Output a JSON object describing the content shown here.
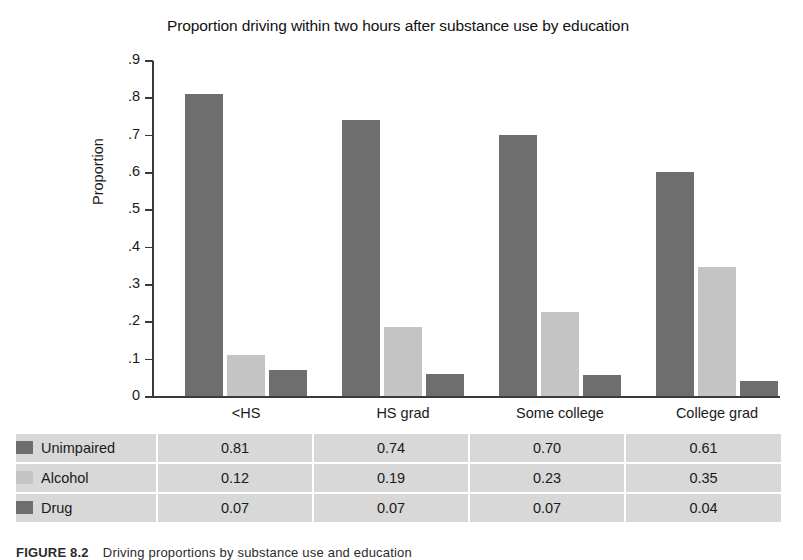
{
  "chart_data": {
    "type": "bar",
    "title": "Proportion driving within two hours after substance use by education",
    "xlabel": "",
    "ylabel": "Proportion",
    "categories": [
      "<HS",
      "HS grad",
      "Some college",
      "College grad"
    ],
    "series": [
      {
        "name": "Unimpaired",
        "color": "#6e6e6e",
        "values": [
          0.81,
          0.74,
          0.7,
          0.6
        ],
        "table_values": [
          "0.81",
          "0.74",
          "0.70",
          "0.61"
        ]
      },
      {
        "name": "Alcohol",
        "color": "#c4c4c4",
        "values": [
          0.11,
          0.185,
          0.225,
          0.345
        ],
        "table_values": [
          "0.12",
          "0.19",
          "0.23",
          "0.35"
        ]
      },
      {
        "name": "Drug",
        "color": "#6e6e6e",
        "values": [
          0.07,
          0.06,
          0.055,
          0.04
        ],
        "table_values": [
          "0.07",
          "0.07",
          "0.07",
          "0.04"
        ]
      }
    ],
    "ylim": [
      0,
      0.9
    ],
    "ytick_labels": [
      ".9",
      ".8",
      ".7",
      ".6",
      ".5",
      ".4",
      ".3",
      ".2",
      ".1",
      "0"
    ],
    "ytick_values": [
      0.9,
      0.8,
      0.7,
      0.6,
      0.5,
      0.4,
      0.3,
      0.2,
      0.1,
      0
    ],
    "grid": false,
    "legend_position": "table-below"
  },
  "table": {
    "rows": [
      {
        "label": "Unimpaired",
        "swatch_color": "#6e6e6e",
        "values": [
          "0.81",
          "0.74",
          "0.70",
          "0.61"
        ]
      },
      {
        "label": "Alcohol",
        "swatch_color": "#c4c4c4",
        "values": [
          "0.12",
          "0.19",
          "0.23",
          "0.35"
        ]
      },
      {
        "label": "Drug",
        "swatch_color": "#6e6e6e",
        "values": [
          "0.07",
          "0.07",
          "0.07",
          "0.04"
        ]
      }
    ],
    "background": "#d8d8d8",
    "gridline_color": "#ffffff"
  },
  "caption": {
    "number": "FIGURE 8.2",
    "text": "Driving proportions by substance use and education"
  },
  "colors": {
    "axis": "#3a3a3a",
    "dark_bar": "#6e6e6e",
    "light_bar": "#c4c4c4",
    "text": "#1a1a1a",
    "page_background": "#ffffff"
  }
}
